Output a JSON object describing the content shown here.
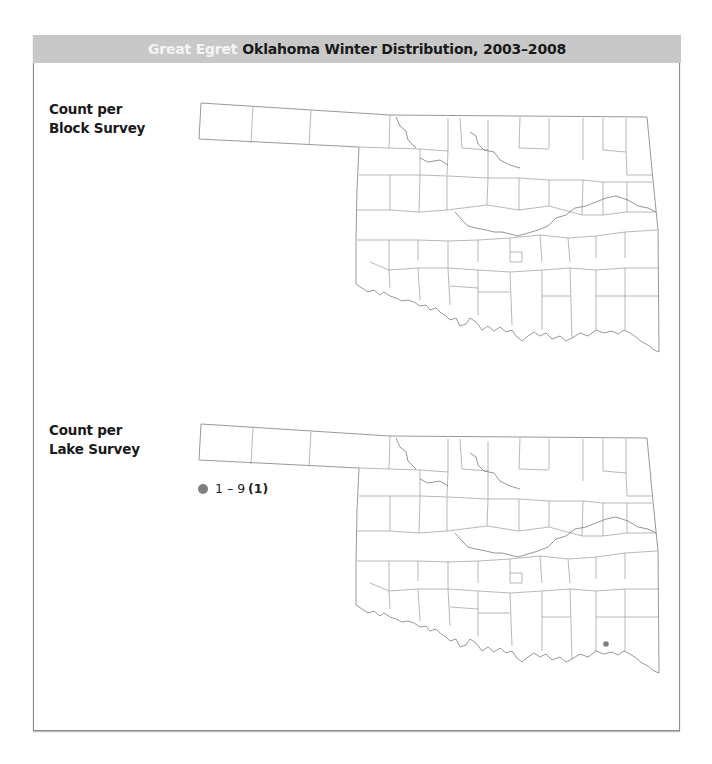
{
  "header": {
    "species": "Great Egret",
    "title": "Oklahoma Winter Distribution, 2003–2008"
  },
  "panels": [
    {
      "label_line1": "Count per",
      "label_line2": "Block Survey",
      "legend": [],
      "points": []
    },
    {
      "label_line1": "Count per",
      "label_line2": "Lake Survey",
      "legend": [
        {
          "range": "1 – 9",
          "count": "(1)",
          "color": "#7f7f7f"
        }
      ],
      "points": [
        {
          "x": 606,
          "y": 644,
          "color": "#7f7f7f",
          "category": "1 – 9"
        }
      ]
    }
  ],
  "colors": {
    "header_bg": "#c8c8c8",
    "species_text": "#f4f4f4",
    "county_lines": "#9a9a9a",
    "point": "#7f7f7f"
  }
}
